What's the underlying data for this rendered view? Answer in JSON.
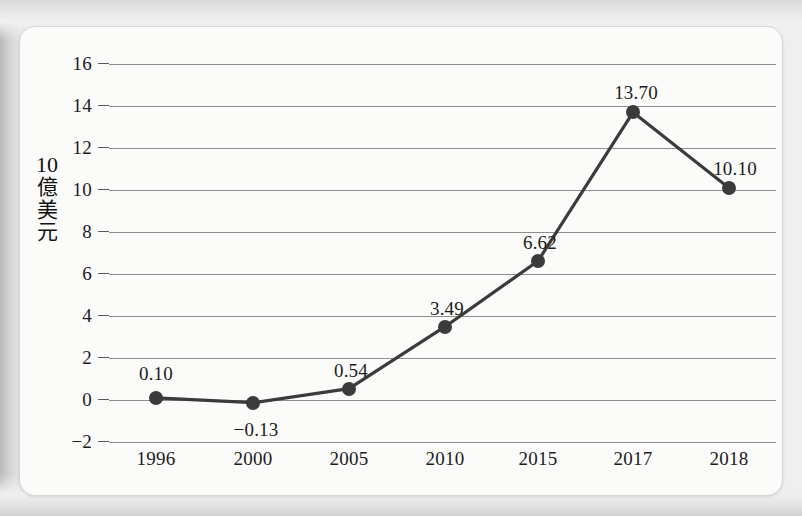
{
  "chart_data": {
    "type": "line",
    "title": "",
    "subtitle": "",
    "xlabel": "",
    "ylabel": "10億美元",
    "ylabel_chars": [
      "10",
      "億",
      "美",
      "元"
    ],
    "categories": [
      "1996",
      "2000",
      "2005",
      "2010",
      "2015",
      "2017",
      "2018"
    ],
    "values": [
      0.1,
      -0.13,
      0.54,
      3.49,
      6.62,
      13.7,
      10.1
    ],
    "point_labels": [
      "0.10",
      "−0.13",
      "0.54",
      "3.49",
      "6.62",
      "13.70",
      "10.10"
    ],
    "ylim": [
      -2,
      16
    ],
    "yticks": [
      16,
      14,
      12,
      10,
      8,
      6,
      4,
      2,
      0,
      -2
    ],
    "ytick_labels": [
      "16",
      "14",
      "12",
      "10",
      "8",
      "6",
      "4",
      "2",
      "0",
      "−2"
    ],
    "grid": true,
    "legend": false,
    "legend_position": "none",
    "series": [
      {
        "name": "",
        "values": [
          0.1,
          -0.13,
          0.54,
          3.49,
          6.62,
          13.7,
          10.1
        ]
      }
    ],
    "colors": {
      "line": "#3b3b3b",
      "marker": "#3b3b3b",
      "gridline": "#8e8e8e",
      "text": "#1c1c1c",
      "card_background": "#fbfbfa",
      "page_background": "#e9e9e9"
    }
  }
}
